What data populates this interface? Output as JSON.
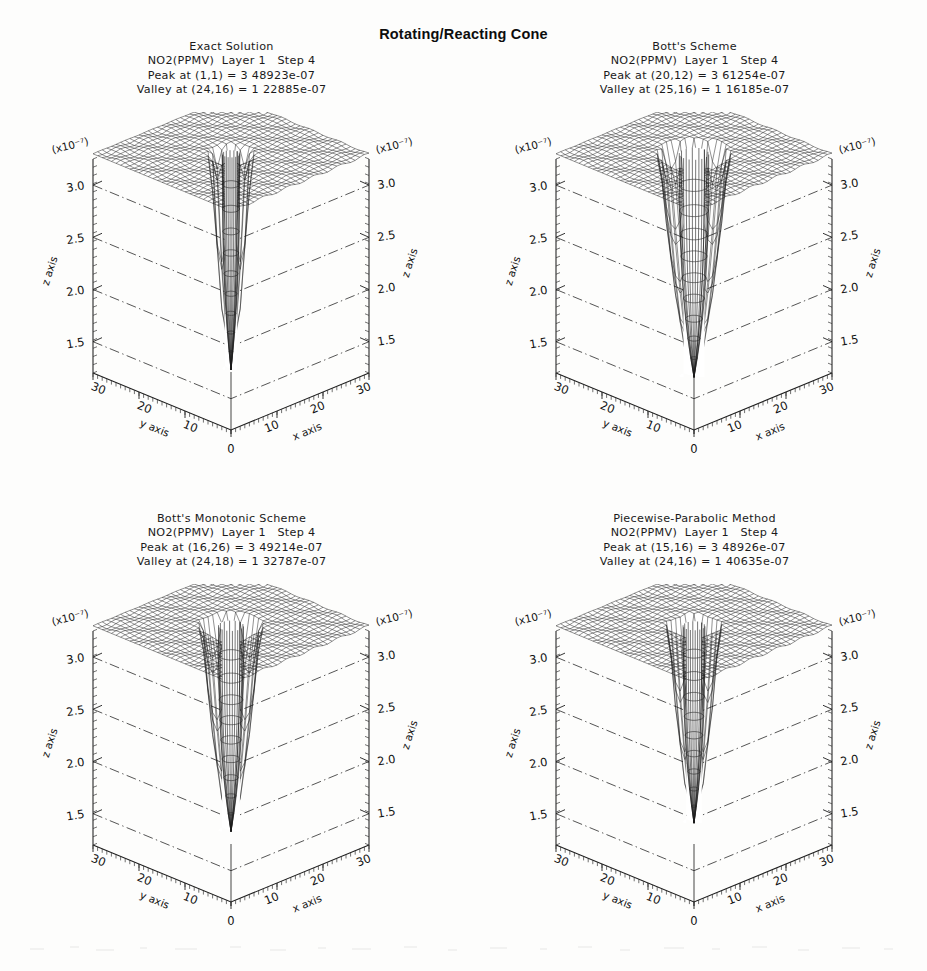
{
  "title": "Rotating/Reacting Cone",
  "axes": {
    "z_exponent_label": "(x10⁻⁷)",
    "z_axis_label": "z axis",
    "x_axis_label": "x axis",
    "y_axis_label": "y axis",
    "z_ticks": [
      "3.0",
      "2.5",
      "2.0",
      "1.5"
    ],
    "x_ticks": [
      "10",
      "20",
      "30"
    ],
    "y_ticks": [
      "10",
      "20",
      "30"
    ],
    "origin_tick": "0",
    "z_range": [
      1.2,
      3.25
    ],
    "x_range": [
      0,
      30
    ],
    "y_range": [
      0,
      30
    ]
  },
  "panels": [
    {
      "id": "exact-solution",
      "method": "Exact Solution",
      "variable_line": "NO2(PPMV)  Layer 1   Step 4",
      "variable": "NO2(PPMV)",
      "layer": "Layer 1",
      "step": "Step 4",
      "peak_line": "Peak at (1,1) = 3 48923e-07",
      "valley_line": "Valley at (24,16) = 1 22885e-07",
      "peak_location": [
        1,
        1
      ],
      "peak_value": "3.48923e-07",
      "valley_location": [
        24,
        16
      ],
      "valley_value": "1.22885e-07"
    },
    {
      "id": "botts-scheme",
      "method": "Bott's Scheme",
      "variable_line": "NO2(PPMV)  Layer 1   Step 4",
      "variable": "NO2(PPMV)",
      "layer": "Layer 1",
      "step": "Step 4",
      "peak_line": "Peak at (20,12) = 3 61254e-07",
      "valley_line": "Valley at (25,16) = 1 16185e-07",
      "peak_location": [
        20,
        12
      ],
      "peak_value": "3.61254e-07",
      "valley_location": [
        25,
        16
      ],
      "valley_value": "1.16185e-07"
    },
    {
      "id": "botts-monotonic-scheme",
      "method": "Bott's Monotonic Scheme",
      "variable_line": "NO2(PPMV)  Layer 1   Step 4",
      "variable": "NO2(PPMV)",
      "layer": "Layer 1",
      "step": "Step 4",
      "peak_line": "Peak at (16,26) = 3 49214e-07",
      "valley_line": "Valley at (24,18) = 1 32787e-07",
      "peak_location": [
        16,
        26
      ],
      "peak_value": "3.49214e-07",
      "valley_location": [
        24,
        18
      ],
      "valley_value": "1.32787e-07"
    },
    {
      "id": "piecewise-parabolic-method",
      "method": "Piecewise-Parabolic Method",
      "variable_line": "NO2(PPMV)  Layer 1   Step 4",
      "variable": "NO2(PPMV)",
      "layer": "Layer 1",
      "step": "Step 4",
      "peak_line": "Peak at (15,16) = 3 48926e-07",
      "valley_line": "Valley at (24,16) = 1 40635e-07",
      "peak_location": [
        15,
        16
      ],
      "peak_value": "3.48926e-07",
      "valley_location": [
        24,
        16
      ],
      "valley_value": "1.40635e-07"
    }
  ],
  "chart_data": {
    "type": "surface",
    "title": "Rotating/Reacting Cone",
    "xlabel": "x axis",
    "ylabel": "y axis",
    "zlabel": "z axis",
    "z_scale": "x10^-7",
    "xlim": [
      0,
      30
    ],
    "ylim": [
      0,
      30
    ],
    "zlim": [
      1.2,
      3.25
    ],
    "grid": true,
    "legend": "none",
    "panel_count": 4,
    "series": [
      {
        "name": "Exact Solution",
        "plateau_level": 3.3,
        "crater_rim_radius": 3.2,
        "cone_depth_bottom": 1.23,
        "peak": {
          "x": 1,
          "y": 1,
          "z": 3.48923
        },
        "valley": {
          "x": 24,
          "y": 16,
          "z": 1.22885
        }
      },
      {
        "name": "Bott's Scheme",
        "plateau_level": 3.3,
        "crater_rim_radius": 5.4,
        "cone_depth_bottom": 1.16,
        "peak": {
          "x": 20,
          "y": 12,
          "z": 3.61254
        },
        "valley": {
          "x": 25,
          "y": 16,
          "z": 1.16185
        }
      },
      {
        "name": "Bott's Monotonic Scheme",
        "plateau_level": 3.3,
        "crater_rim_radius": 4.6,
        "cone_depth_bottom": 1.33,
        "peak": {
          "x": 16,
          "y": 26,
          "z": 3.49214
        },
        "valley": {
          "x": 24,
          "y": 18,
          "z": 1.32787
        }
      },
      {
        "name": "Piecewise-Parabolic Method",
        "plateau_level": 3.3,
        "crater_rim_radius": 4.0,
        "cone_depth_bottom": 1.41,
        "peak": {
          "x": 15,
          "y": 16,
          "z": 3.48926
        },
        "valley": {
          "x": 24,
          "y": 16,
          "z": 1.40635
        }
      }
    ]
  }
}
